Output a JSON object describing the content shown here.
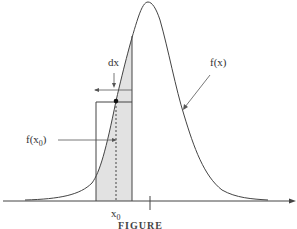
{
  "diagram": {
    "type": "probability-density-illustration",
    "curve_label": "f(x)",
    "point_value_label": {
      "main": "f(x",
      "sub": "0",
      "close": ")"
    },
    "interval_label": "dx",
    "x_point_label": {
      "main": "x",
      "sub": "0"
    },
    "caption_partial": "FIGURE",
    "colors": {
      "line": "#444444",
      "shade": "#e2e2e2",
      "background": "#ffffff"
    }
  }
}
